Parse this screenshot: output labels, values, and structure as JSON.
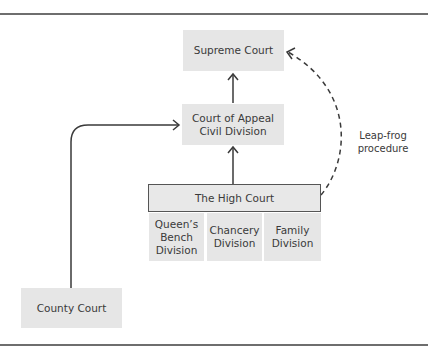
{
  "diagram": {
    "nodes": {
      "supreme_court": "Supreme Court",
      "court_of_appeal_line1": "Court of Appeal",
      "court_of_appeal_line2": "Civil Division",
      "high_court": "The High Court",
      "queens_bench_line1": "Queen’s",
      "queens_bench_line2": "Bench",
      "queens_bench_line3": "Division",
      "chancery_line1": "Chancery",
      "chancery_line2": "Division",
      "family_line1": "Family",
      "family_line2": "Division",
      "county_court": "County Court"
    },
    "edges": [
      {
        "from": "County Court",
        "to": "Court of Appeal Civil Division",
        "style": "solid"
      },
      {
        "from": "The High Court",
        "to": "Court of Appeal Civil Division",
        "style": "solid"
      },
      {
        "from": "Court of Appeal Civil Division",
        "to": "Supreme Court",
        "style": "solid"
      },
      {
        "from": "The High Court",
        "to": "Supreme Court",
        "style": "dashed",
        "label": "Leap-frog procedure"
      }
    ],
    "annotation_line1": "Leap-frog",
    "annotation_line2": "procedure",
    "colors": {
      "box_fill": "#e6e6e6",
      "line": "#3a3a3a",
      "rule": "#6e6e6e"
    }
  }
}
